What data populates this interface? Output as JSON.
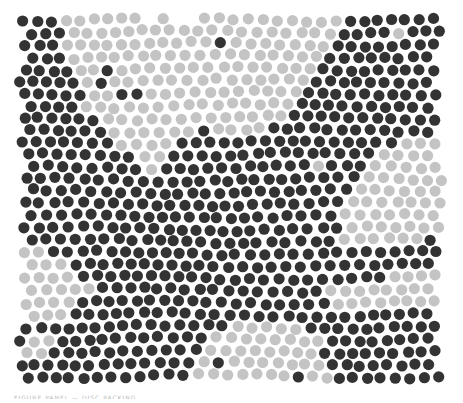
{
  "figure": {
    "bounds": {
      "x0": 15,
      "y0": 14,
      "x1": 447,
      "y1": 388
    },
    "disc_radius": 5.6,
    "spacing": 14.2,
    "colors": {
      "background": "#ffffff",
      "dark": "#333333",
      "light": "#c4c4c4"
    },
    "dark_regions": [
      [
        [
          15,
          14
        ],
        [
          62,
          14
        ],
        [
          70,
          60
        ],
        [
          85,
          110
        ],
        [
          120,
          150
        ],
        [
          150,
          175
        ],
        [
          160,
          160
        ],
        [
          175,
          140
        ],
        [
          205,
          130
        ],
        [
          240,
          140
        ],
        [
          280,
          120
        ],
        [
          310,
          90
        ],
        [
          335,
          40
        ],
        [
          350,
          14
        ],
        [
          447,
          14
        ],
        [
          447,
          135
        ],
        [
          420,
          140
        ],
        [
          390,
          145
        ],
        [
          370,
          160
        ],
        [
          350,
          190
        ],
        [
          335,
          230
        ],
        [
          340,
          250
        ],
        [
          380,
          245
        ],
        [
          420,
          240
        ],
        [
          447,
          235
        ],
        [
          447,
          388
        ],
        [
          330,
          388
        ],
        [
          320,
          340
        ],
        [
          300,
          320
        ],
        [
          260,
          318
        ],
        [
          220,
          330
        ],
        [
          200,
          360
        ],
        [
          180,
          388
        ],
        [
          15,
          388
        ],
        [
          15,
          330
        ],
        [
          60,
          320
        ],
        [
          90,
          290
        ],
        [
          80,
          270
        ],
        [
          50,
          255
        ],
        [
          15,
          245
        ]
      ],
      [
        [
          95,
          78
        ],
        [
          125,
          88
        ],
        [
          150,
          100
        ],
        [
          115,
          100
        ]
      ]
    ],
    "light_islands": [
      [
        [
          320,
          290
        ],
        [
          360,
          280
        ],
        [
          400,
          275
        ],
        [
          447,
          265
        ],
        [
          447,
          310
        ],
        [
          400,
          310
        ],
        [
          360,
          305
        ],
        [
          330,
          305
        ]
      ],
      [
        [
          20,
          335
        ],
        [
          50,
          325
        ],
        [
          60,
          345
        ],
        [
          35,
          360
        ],
        [
          20,
          355
        ]
      ]
    ],
    "stray_dark": [
      [
        215,
        45
      ],
      [
        108,
        78
      ],
      [
        330,
        227
      ],
      [
        375,
        260
      ],
      [
        220,
        365
      ],
      [
        300,
        372
      ],
      [
        222,
        178
      ]
    ],
    "stray_light": [
      [
        398,
        41
      ],
      [
        68,
        296
      ],
      [
        320,
        160
      ]
    ]
  },
  "caption": {
    "text": "FIGURE PANEL — DISC PACKING"
  }
}
